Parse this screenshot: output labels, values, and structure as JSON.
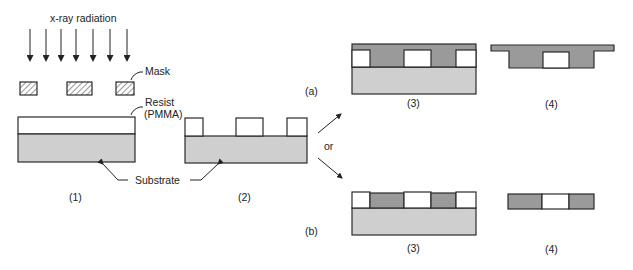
{
  "labels": {
    "radiation": "x-ray radiation",
    "mask": "Mask",
    "resist_line1": "Resist",
    "resist_line2": "(PMMA)",
    "substrate": "Substrate",
    "or": "or",
    "branch_a": "(a)",
    "branch_b": "(b)"
  },
  "steps": {
    "step1": "(1)",
    "step2": "(2)",
    "step3a": "(3)",
    "step4a": "(4)",
    "step3b": "(3)",
    "step4b": "(4)"
  },
  "colors": {
    "substrate": "#cfcfcf",
    "deposit": "#9a9a9a",
    "resist": "#ffffff",
    "outline": "#2a2a2a"
  },
  "arrows_count": 7
}
